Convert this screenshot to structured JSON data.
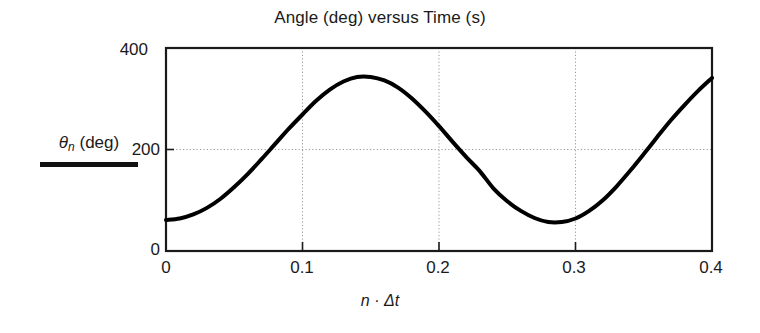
{
  "chart_data": {
    "type": "line",
    "title": "Angle (deg) versus Time (s)",
    "xlabel": "n · Δt",
    "ylabel": "θn (deg)",
    "ylabel_symbol": "θ",
    "ylabel_subscript": "n",
    "ylabel_units": "(deg)",
    "xlim": [
      0,
      0.4
    ],
    "ylim": [
      0,
      400
    ],
    "xticks": [
      0,
      0.1,
      0.2,
      0.3,
      0.4
    ],
    "xtick_labels": [
      "0",
      "0.1",
      "0.2",
      "0.3",
      "0.4"
    ],
    "yticks": [
      0,
      200,
      400
    ],
    "ytick_labels": [
      "0",
      "200",
      "400"
    ],
    "grid": "dotted gray gridlines at x = 0.1, 0.2, 0.3 and y = 200",
    "legend": "none",
    "series": [
      {
        "name": "θn (deg)",
        "color": "#000000",
        "linewidth": 4,
        "x": [
          0,
          0.01,
          0.02,
          0.03,
          0.04,
          0.05,
          0.06,
          0.07,
          0.08,
          0.09,
          0.1,
          0.11,
          0.12,
          0.13,
          0.14,
          0.15,
          0.16,
          0.17,
          0.18,
          0.19,
          0.2,
          0.21,
          0.22,
          0.23,
          0.24,
          0.25,
          0.26,
          0.27,
          0.28,
          0.29,
          0.3,
          0.31,
          0.32,
          0.33,
          0.34,
          0.35,
          0.36,
          0.37,
          0.38,
          0.39,
          0.4
        ],
        "values": [
          61,
          64,
          72,
          85,
          103,
          126,
          152,
          181,
          211,
          241,
          269,
          296,
          318,
          334,
          343,
          343,
          336,
          322,
          301,
          275,
          246,
          215,
          185,
          157,
          123,
          98,
          79,
          65,
          57,
          57,
          64,
          79,
          100,
          127,
          158,
          191,
          225,
          258,
          288,
          316,
          341
        ]
      }
    ],
    "annotations": {
      "start_value": 61,
      "peak_value": 343,
      "peak_time": 0.138,
      "trough_value": 57,
      "trough_time": 0.283,
      "end_value": 341,
      "mean": 200,
      "amplitude": 143,
      "period": 0.29
    }
  },
  "colors": {
    "curve": "#000000",
    "axis": "#1a1a1a",
    "grid": "#9a9a9a",
    "background": "#ffffff"
  }
}
